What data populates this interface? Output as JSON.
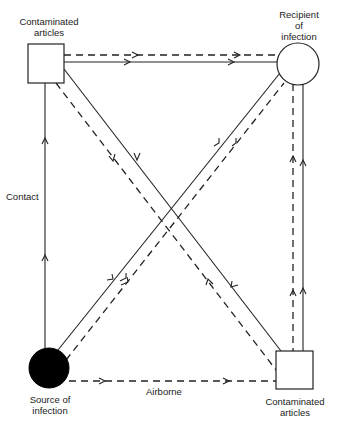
{
  "diagram": {
    "nodes": {
      "contaminated_top": {
        "label_line1": "Contaminated",
        "label_line2": "articles",
        "shape": "square-outline"
      },
      "recipient": {
        "label_line1": "Recipient",
        "label_line2": "of",
        "label_line3": "infection",
        "shape": "circle-outline"
      },
      "source": {
        "label_line1": "Source of",
        "label_line2": "infection",
        "shape": "circle-filled"
      },
      "contaminated_bottom": {
        "label_line1": "Contaminated",
        "label_line2": "articles",
        "shape": "square-outline"
      }
    },
    "edge_labels": {
      "contact": "Contact",
      "airborne": "Airborne"
    },
    "legend": {
      "solid_line": "Contact route",
      "dashed_line": "Airborne route"
    },
    "colors": {
      "line": "#222222",
      "background": "#ffffff",
      "filled_node": "#000000"
    }
  }
}
